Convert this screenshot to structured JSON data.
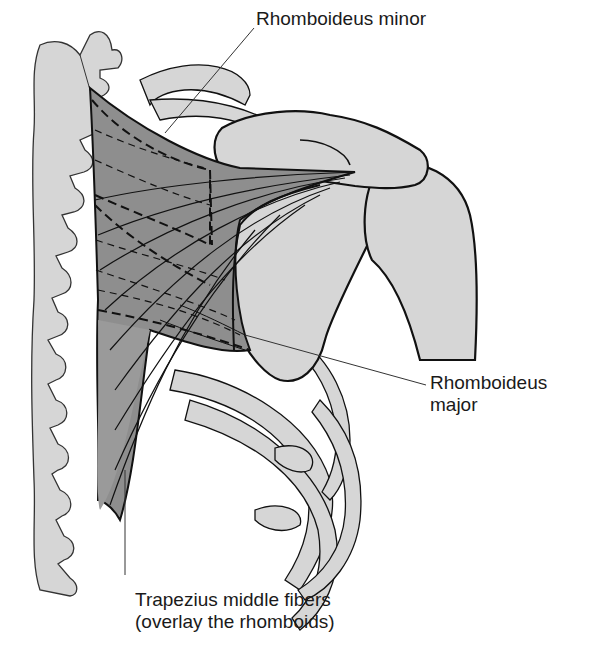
{
  "figure": {
    "colors": {
      "bone": "#d6d6d6",
      "muscle": "#8e8e8e",
      "outline": "#111111",
      "leader_line": "#333333",
      "background": "#ffffff"
    }
  },
  "labels": {
    "rhomboideus_minor": {
      "line1": "Rhomboideus minor"
    },
    "rhomboideus_major": {
      "line1": "Rhomboideus",
      "line2": "major"
    },
    "trapezius": {
      "line1": "Trapezius middle fibers",
      "line2": "(overlay the rhomboids)"
    }
  }
}
